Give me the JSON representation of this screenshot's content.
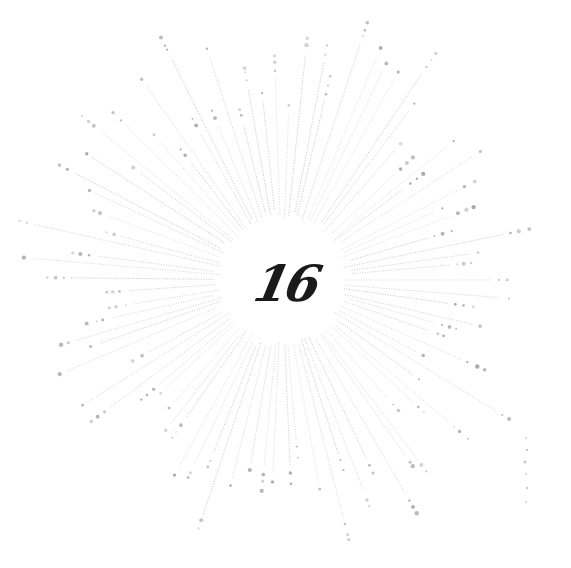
{
  "image": {
    "center_text": "16",
    "colors": {
      "background": "#ffffff",
      "ray": "#9a9a9a",
      "ray_dot": "#8c8c8c",
      "number": "#1a1a1a"
    },
    "sunburst": {
      "center_x": 282,
      "center_y": 280,
      "inner_radius": 62,
      "ray_count": 90,
      "min_length": 150,
      "max_length": 255
    }
  }
}
